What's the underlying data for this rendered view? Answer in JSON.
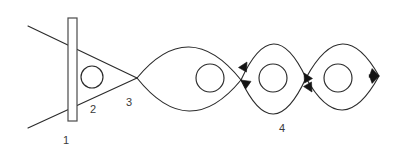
{
  "figure": {
    "type": "line-diagram",
    "title": "",
    "background_color": "#ffffff",
    "stroke_color": "#2b2b2b",
    "arrow_color": "#141414",
    "label_color": "#3a3a3a",
    "width": 397,
    "height": 162
  },
  "labels": [
    {
      "id": "label-1",
      "text": "1",
      "x": 66,
      "y": 141
    },
    {
      "id": "label-2",
      "text": "2",
      "x": 93,
      "y": 110
    },
    {
      "id": "label-3",
      "text": "3",
      "x": 129,
      "y": 103
    },
    {
      "id": "label-4",
      "text": "4",
      "x": 282,
      "y": 129
    }
  ],
  "plate": {
    "name": "vertical-plate",
    "x": 68,
    "y": 18,
    "width": 9,
    "height": 103
  },
  "rays": [
    {
      "name": "ray-upper",
      "x1": 28,
      "y1": 26,
      "x2": 137,
      "y2": 78
    },
    {
      "name": "ray-lower",
      "x1": 28,
      "y1": 128,
      "x2": 137,
      "y2": 78
    }
  ],
  "circles": [
    {
      "name": "circle-1",
      "cx": 92,
      "cy": 77,
      "r": 11
    },
    {
      "name": "circle-2",
      "cx": 210,
      "cy": 78,
      "r": 14
    },
    {
      "name": "circle-3",
      "cx": 273,
      "cy": 78,
      "r": 14
    },
    {
      "name": "circle-4",
      "cx": 338,
      "cy": 78,
      "r": 14
    }
  ],
  "nodes": [
    {
      "name": "node-crossing",
      "x": 137,
      "y": 78
    },
    {
      "name": "node-1",
      "x": 241,
      "y": 80
    },
    {
      "name": "node-2",
      "x": 306,
      "y": 78
    },
    {
      "name": "node-tip",
      "x": 379,
      "y": 76
    }
  ],
  "lobes": [
    {
      "name": "lobe-1",
      "from_x": 137,
      "from_y": 78,
      "to_x": 241,
      "to_y": 80,
      "bulge": 32
    },
    {
      "name": "lobe-2",
      "from_x": 241,
      "from_y": 80,
      "to_x": 306,
      "to_y": 78,
      "bulge": 35
    },
    {
      "name": "lobe-3",
      "from_x": 306,
      "from_y": 78,
      "to_x": 379,
      "to_y": 76,
      "bulge": 33
    }
  ],
  "arrows": [
    {
      "name": "arrow-into-node-1-down-left",
      "x": 241,
      "y": 80,
      "angle": 215
    },
    {
      "name": "arrow-out-node-1-up-right",
      "x": 247,
      "y": 62,
      "angle": 300
    },
    {
      "name": "arrow-into-node-2-up-left",
      "x": 304,
      "y": 73,
      "angle": 240
    },
    {
      "name": "arrow-out-node-2-down",
      "x": 312,
      "y": 92,
      "angle": 60
    },
    {
      "name": "arrow-tip-upper",
      "x": 379,
      "y": 76,
      "angle": 340
    },
    {
      "name": "arrow-tip-lower",
      "x": 379,
      "y": 76,
      "angle": 20
    }
  ]
}
